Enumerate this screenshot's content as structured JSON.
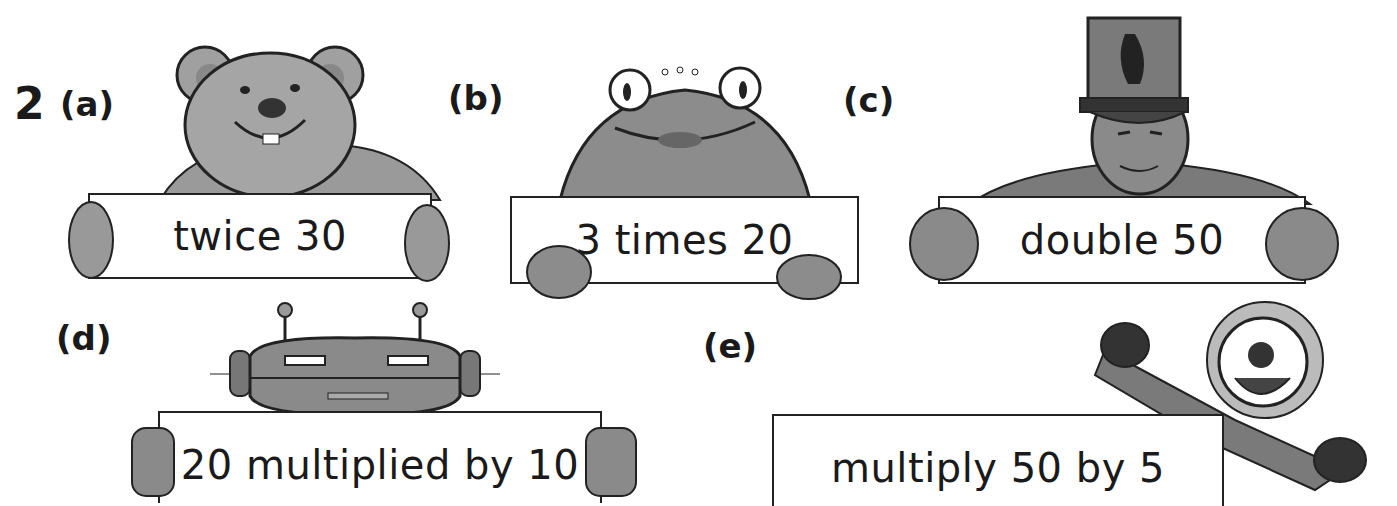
{
  "question": {
    "number": "2",
    "parts": [
      {
        "label": "(a)",
        "sign_text": "twice 30",
        "character": "teddy-bear"
      },
      {
        "label": "(b)",
        "sign_text": "3 times 20",
        "character": "frog"
      },
      {
        "label": "(c)",
        "sign_text": "double 50",
        "character": "soldier"
      },
      {
        "label": "(d)",
        "sign_text": "20 multiplied by 10",
        "character": "robot"
      },
      {
        "label": "(e)",
        "sign_text": "multiply 50 by 5",
        "character": "clown"
      }
    ]
  },
  "colors": {
    "ink": "#1a1a1a",
    "fill_mid": "#8a8a8a",
    "fill_light": "#b5b5b5",
    "fill_dark": "#555555",
    "paper": "#ffffff"
  }
}
